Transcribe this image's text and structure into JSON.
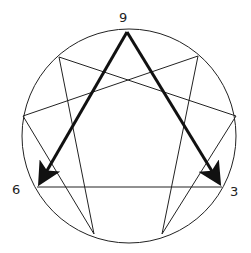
{
  "diagram": {
    "type": "enneagram",
    "labels": {
      "top": "9",
      "left": "6",
      "right": "3"
    },
    "colors": {
      "line": "#222222",
      "background": "#ffffff"
    }
  }
}
